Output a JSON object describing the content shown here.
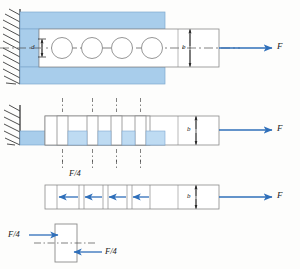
{
  "figure": {
    "title_hidden": "",
    "colors": {
      "plate_fill": "#a8cdeb",
      "plate_fill_light": "#bedbf2",
      "arrow_blue": "#2f6fba",
      "outline": "#8a8a8a",
      "outline_dark": "#5a5a5a",
      "wall_hatch": "#3a3a3a",
      "centerline": "#4a4a4a",
      "background": "#fdfdfc"
    },
    "panels": [
      {
        "id": "panel-assembly",
        "name": "riveted-joint-assembly",
        "description": "Lap joint: fixed wall, blue bracket plate, white strap plate with four rivets on centerline",
        "fastener_count": 4,
        "labels": [
          {
            "text": "d",
            "role": "rivet-diameter-dimension"
          },
          {
            "text": "b",
            "role": "plate-width-dimension"
          },
          {
            "text": "F",
            "role": "applied-load"
          }
        ]
      },
      {
        "id": "panel-exploded",
        "name": "joint-section-view",
        "description": "Section through joint showing four fastener shear planes with dash-dot axes",
        "fastener_count": 4,
        "labels": [
          {
            "text": "b",
            "role": "plate-width-dimension"
          },
          {
            "text": "F",
            "role": "applied-load"
          }
        ]
      },
      {
        "id": "panel-fbd-strap",
        "name": "strap-free-body-diagram",
        "description": "Free body of strap plate: four equal F/4 fastener reactions opposing load F",
        "fastener_count": 4,
        "labels": [
          {
            "text": "F/4",
            "role": "fastener-shear-force"
          },
          {
            "text": "b",
            "role": "plate-width-dimension"
          },
          {
            "text": "F",
            "role": "applied-load"
          }
        ]
      },
      {
        "id": "panel-fbd-fastener",
        "name": "single-fastener-free-body-diagram",
        "description": "Free body of one fastener in double shear with F/4 on each face",
        "labels": [
          {
            "text": "F/4",
            "role": "shear-force-upper-left"
          },
          {
            "text": "F/4",
            "role": "shear-force-lower-right"
          }
        ]
      }
    ],
    "annotations": {
      "F": "F",
      "F_over_4": "F/4",
      "d": "d",
      "b": "b"
    }
  }
}
